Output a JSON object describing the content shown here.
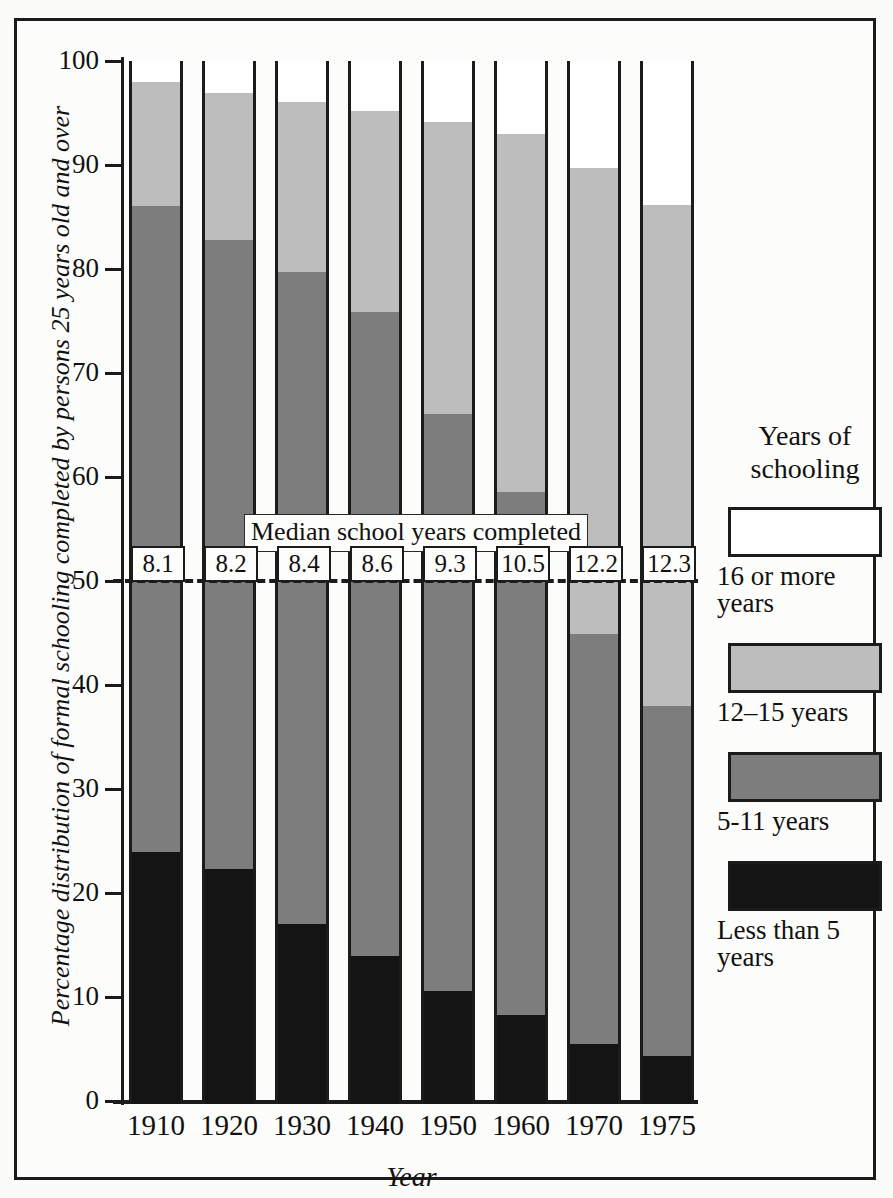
{
  "chart_data": {
    "type": "bar",
    "subtype": "stacked-percentage",
    "title": "",
    "xlabel": "Year",
    "ylabel": "Percentage distribution of formal schooling completed by persons 25 years old and over",
    "categories": [
      "1910",
      "1920",
      "1930",
      "1940",
      "1950",
      "1960",
      "1970",
      "1975"
    ],
    "ylim": [
      0,
      100
    ],
    "yticks": [
      "0",
      "10",
      "20",
      "30",
      "40",
      "50",
      "60",
      "70",
      "80",
      "90",
      "100"
    ],
    "grid": false,
    "legend_position": "right",
    "legend_title": "Years of schooling",
    "series": [
      {
        "name": "Less than 5 years",
        "color": "#141414",
        "values": [
          24.2,
          22.6,
          17.3,
          14.2,
          10.9,
          8.6,
          5.8,
          4.6
        ]
      },
      {
        "name": "5-11 years",
        "color": "#7d7d7d",
        "values": [
          62.1,
          60.5,
          62.7,
          62.0,
          55.4,
          50.2,
          39.4,
          33.7
        ]
      },
      {
        "name": "12–15 years",
        "color": "#bdbdbd",
        "values": [
          12.0,
          14.1,
          16.3,
          19.3,
          28.1,
          34.5,
          44.8,
          48.1
        ]
      },
      {
        "name": "16 or more years",
        "color": "#ffffff",
        "values": [
          1.7,
          2.8,
          3.7,
          4.5,
          5.6,
          6.7,
          10.0,
          13.6
        ]
      }
    ],
    "cumulative_tops": {
      "less_than_5": [
        24.2,
        22.6,
        17.3,
        14.2,
        10.9,
        8.6,
        5.8,
        4.6
      ],
      "through_5_11": [
        86.3,
        83.1,
        80.0,
        76.2,
        66.3,
        58.8,
        45.2,
        38.3
      ],
      "through_12_15": [
        98.3,
        97.2,
        96.3,
        95.5,
        94.4,
        93.3,
        90.0,
        86.4
      ],
      "total": [
        100,
        100,
        100,
        100,
        100,
        100,
        100,
        100
      ]
    },
    "annotation": {
      "caption": "Median school years completed",
      "reference_line_value": 50,
      "reference_line_style": "dashed",
      "values": [
        "8.1",
        "8.2",
        "8.4",
        "8.6",
        "9.3",
        "10.5",
        "12.2",
        "12.3"
      ]
    }
  },
  "axes": {
    "y_title": "Percentage distribution of formal schooling completed by persons 25 years old and over",
    "x_title": "Year",
    "y_ticks": [
      "100",
      "90",
      "80",
      "70",
      "60",
      "50",
      "40",
      "30",
      "20",
      "10",
      "0"
    ],
    "x_ticks": [
      "1910",
      "1920",
      "1930",
      "1940",
      "1950",
      "1960",
      "1970",
      "1975"
    ]
  },
  "legend": {
    "title_line1": "Years of",
    "title_line2": "schooling",
    "items": [
      {
        "label": "16 or more years",
        "swatch": "sw-white"
      },
      {
        "label": "12–15 years",
        "swatch": "sw-light"
      },
      {
        "label": "5-11 years",
        "swatch": "sw-mid"
      },
      {
        "label": "Less than 5 years",
        "swatch": "sw-black"
      }
    ]
  },
  "median": {
    "caption": "Median school years completed",
    "labels": [
      "8.1",
      "8.2",
      "8.4",
      "8.6",
      "9.3",
      "10.5",
      "12.2",
      "12.3"
    ]
  }
}
